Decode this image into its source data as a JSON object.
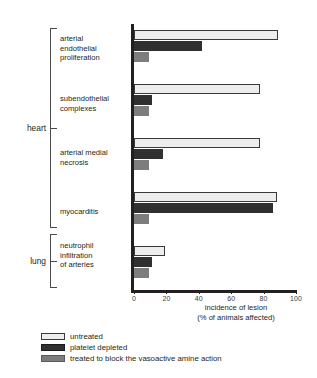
{
  "chart_data": {
    "type": "bar",
    "orientation": "horizontal",
    "title": "",
    "xlabel": "incidence of lesion (% of animals affected)",
    "xlabel_line1": "incidence of lesion",
    "xlabel_line2": "(% of animals affected)",
    "ylabel": "",
    "xlim": [
      0,
      100
    ],
    "xticks": [
      0,
      20,
      40,
      60,
      80,
      100
    ],
    "xtick_labels": [
      "0",
      "20",
      "40",
      "60",
      "80",
      "100"
    ],
    "grid": false,
    "legend_position": "bottom-left",
    "categories": [
      "arterial endothelial proliferation",
      "subendothelial complexes",
      "arterial medial necrosis",
      "myocarditis",
      "neutrophil infiltration of arteries"
    ],
    "category_lines": [
      [
        "arterial",
        "endothelial",
        "proliferation"
      ],
      [
        "subendothelial",
        "complexes"
      ],
      [
        "arterial medial",
        "necrosis"
      ],
      [
        "myocarditis"
      ],
      [
        "neutrophil",
        "infiltration",
        "of arteries"
      ]
    ],
    "organ_groups": [
      {
        "label": "heart",
        "categories": [
          0,
          1,
          2,
          3
        ]
      },
      {
        "label": "lung",
        "categories": [
          4
        ]
      }
    ],
    "series": [
      {
        "name": "untreated",
        "color": "#ededed",
        "values": [
          89,
          78,
          78,
          88,
          19
        ]
      },
      {
        "name": "platelet depleted",
        "color": "#303030",
        "values": [
          42,
          11,
          18,
          86,
          11
        ]
      },
      {
        "name": "treated to block the vasoactive amine action",
        "color": "#7d7d7d",
        "values": [
          9,
          9,
          9,
          9,
          9
        ]
      }
    ]
  },
  "legend": {
    "items": [
      {
        "label": "untreated",
        "swatch": "untreated"
      },
      {
        "label": "platelet depleted",
        "swatch": "depleted"
      },
      {
        "label": "treated to block the vasoactive amine action",
        "swatch": "blocked"
      }
    ]
  },
  "colors": {
    "untreated": "#ededed",
    "platelet_depleted": "#303030",
    "amine_blocked": "#7d7d7d",
    "axis": "#231f20",
    "background": "#ffffff"
  }
}
